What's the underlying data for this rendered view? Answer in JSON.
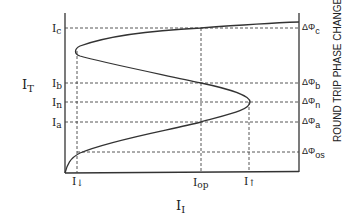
{
  "diagram": {
    "type": "bistable transfer characteristic",
    "y_axis": {
      "label": "I",
      "label_sub": "T",
      "ticks": [
        {
          "name": "I",
          "sub": "c",
          "y": 28
        },
        {
          "name": "I",
          "sub": "b",
          "y": 83
        },
        {
          "name": "I",
          "sub": "n",
          "y": 102
        },
        {
          "name": "I",
          "sub": "a",
          "y": 122
        }
      ]
    },
    "x_axis": {
      "label": "I",
      "label_sub": "I",
      "ticks": [
        {
          "name": "I",
          "sub": "↓",
          "x": 77
        },
        {
          "name": "I",
          "sub": "op",
          "x": 201
        },
        {
          "name": "I",
          "sub": "↑",
          "x": 249
        }
      ]
    },
    "right_axis": {
      "title": "ROUND TRIP PHASE CHANGE",
      "ticks": [
        {
          "name": "ΔΦ",
          "sub": "c",
          "y": 28
        },
        {
          "name": "ΔΦ",
          "sub": "b",
          "y": 83
        },
        {
          "name": "ΔΦ",
          "sub": "n",
          "y": 102
        },
        {
          "name": "ΔΦ",
          "sub": "a",
          "y": 122
        },
        {
          "name": "ΔΦ",
          "sub": "os",
          "y": 152
        }
      ]
    },
    "colors": {
      "line": "#333333",
      "dash": "#444444"
    }
  }
}
